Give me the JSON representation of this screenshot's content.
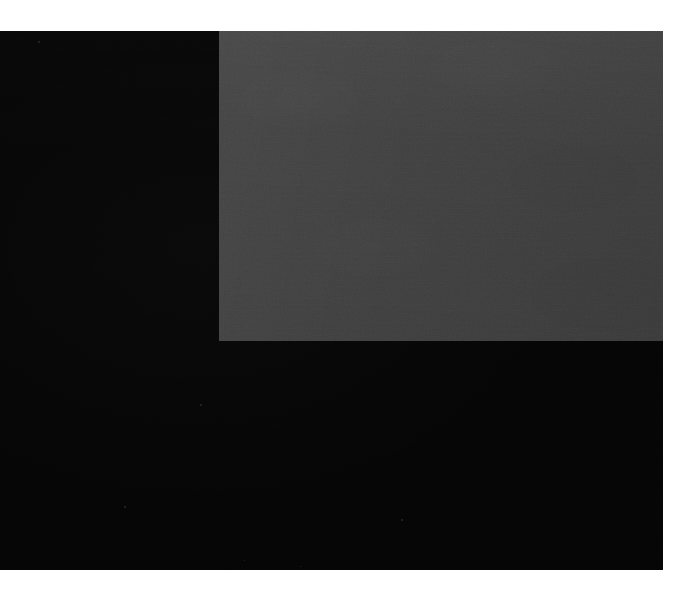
{
  "image": {
    "kind": "photograph-of-flat-color-blocks",
    "canvas_width": 674,
    "canvas_height": 597,
    "page_background_color": "#ffffff",
    "visible_text": "",
    "description": "A scanned/photographed page showing two overlapping flat tonal blocks: a large near-black field occupying most of the frame, with a mid-dark gray rectangle filling the upper-right portion. No text, labels, icons or interface controls are visible.",
    "margins": {
      "top_white_margin_px": 31,
      "bottom_white_margin_px": 27,
      "left_white_margin_px": 0,
      "right_white_margin_px": 11
    }
  },
  "regions": [
    {
      "name": "dark-field",
      "label": "near-black field",
      "color": "#050505",
      "x": 0,
      "y": 31,
      "width": 663,
      "height": 539
    },
    {
      "name": "gray-field",
      "label": "mid-gray rectangle",
      "color": "#3e3e3e",
      "x": 219,
      "y": 31,
      "width": 444,
      "height": 310
    }
  ],
  "specks": [
    {
      "x": 38,
      "y": 41,
      "size": 2
    },
    {
      "x": 200,
      "y": 404,
      "size": 2
    },
    {
      "x": 124,
      "y": 506,
      "size": 2
    },
    {
      "x": 401,
      "y": 519,
      "size": 2
    },
    {
      "x": 244,
      "y": 560,
      "size": 1
    },
    {
      "x": 300,
      "y": 566,
      "size": 1
    }
  ],
  "palette": {
    "background": "#ffffff",
    "dark": "#050505",
    "gray": "#3e3e3e",
    "gray_light_edge": "#464646",
    "gray_dark_edge": "#363636",
    "speck": "#2a2a2a"
  }
}
